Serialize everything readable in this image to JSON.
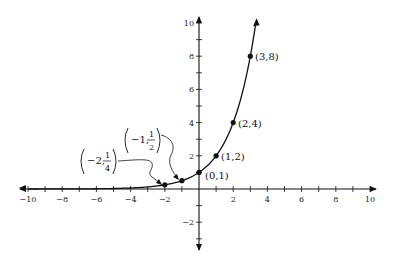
{
  "chart_data": {
    "type": "line",
    "title": "",
    "function": "y = 2^x",
    "xlabel": "",
    "ylabel": "",
    "xlim": [
      -10,
      10
    ],
    "ylim": [
      -3,
      10
    ],
    "grid": false,
    "x_ticks": [
      -10,
      -9,
      -8,
      -7,
      -6,
      -5,
      -4,
      -3,
      -2,
      -1,
      1,
      2,
      3,
      4,
      5,
      6,
      7,
      8,
      9,
      10
    ],
    "x_tick_labels": [
      "-10",
      "-8",
      "-6",
      "-4",
      "-2",
      "2",
      "4",
      "6",
      "8",
      "10"
    ],
    "x_tick_label_values": [
      -10,
      -8,
      -6,
      -4,
      -2,
      2,
      4,
      6,
      8,
      10
    ],
    "y_ticks": [
      -3,
      -2,
      -1,
      1,
      2,
      3,
      4,
      5,
      6,
      7,
      8,
      9,
      10
    ],
    "y_tick_labels": [
      "-2",
      "2",
      "4",
      "6",
      "8",
      "10"
    ],
    "y_tick_label_values": [
      -2,
      2,
      4,
      6,
      8,
      10
    ],
    "points": [
      {
        "x": -2,
        "y": 0.25,
        "label": "(−2, 1/4)"
      },
      {
        "x": -1,
        "y": 0.5,
        "label": "(−1, 1/2)"
      },
      {
        "x": 0,
        "y": 1,
        "label": "(0,1)"
      },
      {
        "x": 1,
        "y": 2,
        "label": "(1,2)"
      },
      {
        "x": 2,
        "y": 4,
        "label": "(2,4)"
      },
      {
        "x": 3,
        "y": 8,
        "label": "(3,8)"
      }
    ],
    "annotations": [
      {
        "text": "(−2, 1/4)",
        "arrow_to": [
          -2,
          0.25
        ]
      },
      {
        "text": "(−1, 1/2)",
        "arrow_to": [
          -1,
          0.5
        ]
      }
    ]
  },
  "labels": {
    "p0": "(0,1)",
    "p1": "(1,2)",
    "p2": "(2,4)",
    "p3": "(3,8)",
    "neg2_whole": "−2,",
    "neg2_num": "1",
    "neg2_den": "4",
    "neg1_whole": "−1,",
    "neg1_num": "1",
    "neg1_den": "2"
  }
}
